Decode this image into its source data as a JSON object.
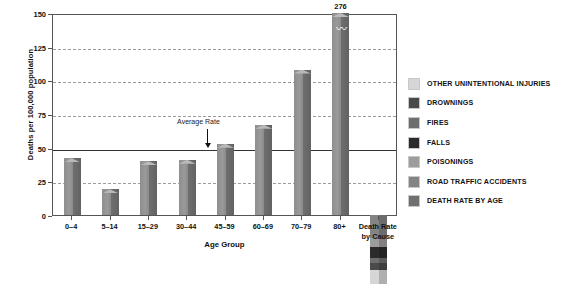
{
  "chart_data": {
    "type": "bar",
    "title": "",
    "subtitle": "",
    "xlabel": "Age Group",
    "ylabel": "Deaths per 100,000 population",
    "ylim": [
      0,
      150
    ],
    "yticks": [
      0,
      25,
      50,
      75,
      100,
      125,
      150
    ],
    "ytick_labels": [
      "0",
      "25",
      "50",
      "75",
      "100",
      "125",
      "150"
    ],
    "grid": true,
    "legend_position": "right",
    "categories": [
      "0–4",
      "5–14",
      "15–29",
      "30–44",
      "45–59",
      "60–69",
      "70–79",
      "80+",
      "Death Rate by Cause"
    ],
    "series": [
      {
        "name": "DEATH RATE BY AGE",
        "values": [
          42,
          19,
          40,
          41,
          53,
          67,
          108,
          276,
          null
        ],
        "value_labels": [
          "",
          "",
          "",
          "",
          "",
          "",
          "",
          "276",
          ""
        ]
      }
    ],
    "stacked_bar": {
      "category": "Death Rate by Cause",
      "total": 51,
      "axis_clipped_at": 150,
      "segments": [
        {
          "name": "OTHER UNINTENTIONAL INJURIES",
          "value": 10,
          "color": "#d6d6d6"
        },
        {
          "name": "DROWNINGS",
          "value": 5,
          "color": "#4a4a4a"
        },
        {
          "name": "FIRES",
          "value": 4,
          "color": "#6e6e6e"
        },
        {
          "name": "FALLS",
          "value": 8,
          "color": "#2b2b2b"
        },
        {
          "name": "POISONINGS",
          "value": 7,
          "color": "#9d9d9d"
        },
        {
          "name": "ROAD TRAFFIC ACCIDENTS",
          "value": 17,
          "color": "#848484"
        }
      ]
    },
    "annotations": [
      {
        "text": "Average Rate",
        "value": 50,
        "marker": "down-arrow",
        "line": "solid horizontal reference line at 50"
      }
    ],
    "axis_break": {
      "applies_to": "80+",
      "symbol": "zigzag",
      "note": "bar truncated at top of axis; true value 276"
    },
    "legend": [
      {
        "label": "OTHER UNINTENTIONAL INJURIES",
        "color": "#d6d6d6"
      },
      {
        "label": "DROWNINGS",
        "color": "#4a4a4a"
      },
      {
        "label": "FIRES",
        "color": "#6e6e6e"
      },
      {
        "label": "FALLS",
        "color": "#2b2b2b"
      },
      {
        "label": "POISONINGS",
        "color": "#9d9d9d"
      },
      {
        "label": "ROAD TRAFFIC ACCIDENTS",
        "color": "#848484"
      },
      {
        "label": "DEATH RATE BY AGE",
        "color": "#707070"
      }
    ]
  }
}
